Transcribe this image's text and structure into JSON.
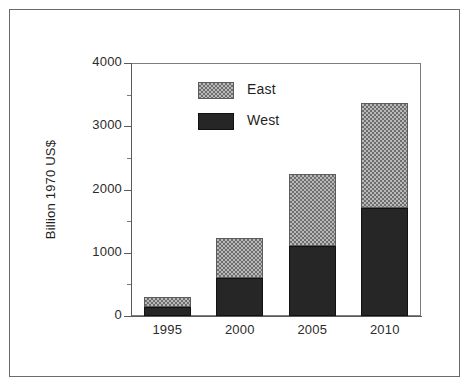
{
  "figure": {
    "frame_color": "#6b6b6b",
    "background": "#ffffff"
  },
  "chart_data": {
    "type": "bar",
    "subtype": "stacked-vertical",
    "title": "",
    "xlabel": "",
    "ylabel": "Billion 1970 US$",
    "categories": [
      "1995",
      "2000",
      "2005",
      "2010"
    ],
    "series": [
      {
        "name": "West",
        "values": [
          150,
          600,
          1100,
          1700
        ],
        "color": "#262626",
        "fill": "solid-black"
      },
      {
        "name": "East",
        "values": [
          150,
          630,
          1150,
          1670
        ],
        "color": "#b9b9b9",
        "fill": "checkerboard-gray"
      }
    ],
    "totals": [
      300,
      1230,
      2250,
      3370
    ],
    "ylim": [
      0,
      4000
    ],
    "yticks": [
      0,
      1000,
      2000,
      3000,
      4000
    ],
    "ytick_labels": [
      "0",
      "1000",
      "2000",
      "3000",
      "4000"
    ],
    "yminor_ticks": [
      500,
      1500,
      2500,
      3500
    ],
    "grid": false,
    "legend_position": "upper-left-inside",
    "stack_order_bottom_to_top": [
      "West",
      "East"
    ]
  },
  "legend": {
    "entries": [
      {
        "label": "East",
        "swatch": "checkerboard-gray"
      },
      {
        "label": "West",
        "swatch": "solid-black"
      }
    ]
  },
  "axes": {
    "y_title": "Billion 1970 US$",
    "y_labels": [
      "4000",
      "3000",
      "2000",
      "1000",
      "0"
    ],
    "x_labels": [
      "1995",
      "2000",
      "2005",
      "2010"
    ]
  }
}
